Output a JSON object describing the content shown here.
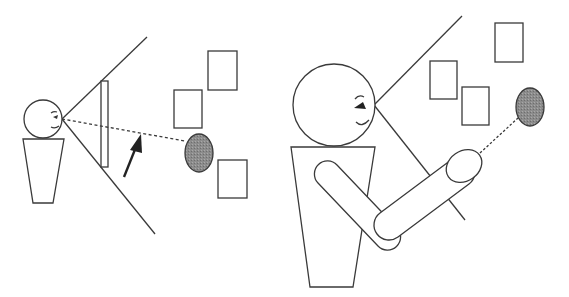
{
  "diagram": {
    "type": "illustration",
    "colors": {
      "line": "#3a3a3a",
      "target_fill": "#8a8a8a",
      "background": "#ffffff"
    },
    "left_panel": {
      "person": {
        "head": {
          "cx": 43,
          "cy": 119,
          "r": 19
        }
      },
      "screen": {
        "x": 101,
        "y": 81,
        "w": 7,
        "h": 86
      },
      "view_frustum": {
        "apex": [
          62,
          119
        ],
        "top_end": [
          147,
          37
        ],
        "bottom_end": [
          155,
          234
        ]
      },
      "gaze_line": {
        "from": [
          62,
          119
        ],
        "to": [
          185,
          140
        ],
        "style": "dotted"
      },
      "arrow": {
        "from": [
          124,
          177
        ],
        "to": [
          141,
          134
        ]
      },
      "target": {
        "cx": 199,
        "cy": 153,
        "rx": 14,
        "ry": 19
      },
      "distractors": [
        {
          "x": 174,
          "y": 90,
          "w": 28,
          "h": 38
        },
        {
          "x": 208,
          "y": 51,
          "w": 29,
          "h": 39
        },
        {
          "x": 218,
          "y": 160,
          "w": 29,
          "h": 38
        }
      ]
    },
    "right_panel": {
      "person": {
        "head": {
          "cx": 334,
          "cy": 105,
          "r": 41
        }
      },
      "view_frustum": {
        "apex": [
          374,
          105
        ],
        "top_end": [
          462,
          16
        ],
        "bottom_end": [
          465,
          220
        ]
      },
      "pointing_line": {
        "from": [
          480,
          152
        ],
        "to": [
          518,
          118
        ],
        "style": "dotted"
      },
      "target": {
        "cx": 530,
        "cy": 107,
        "rx": 14,
        "ry": 19
      },
      "distractors": [
        {
          "x": 430,
          "y": 61,
          "w": 27,
          "h": 38
        },
        {
          "x": 495,
          "y": 23,
          "w": 28,
          "h": 39
        },
        {
          "x": 462,
          "y": 87,
          "w": 27,
          "h": 38
        }
      ]
    }
  }
}
